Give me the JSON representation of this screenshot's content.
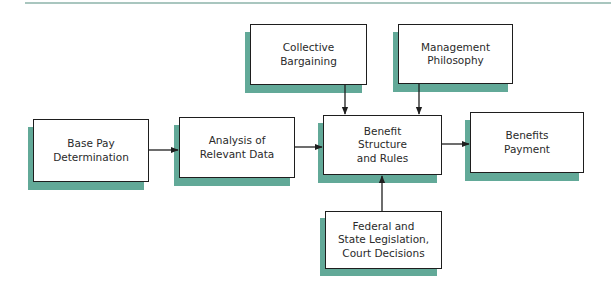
{
  "diagram": {
    "nodes": [
      {
        "id": "base-pay",
        "label": "Base Pay\nDetermination"
      },
      {
        "id": "analysis",
        "label": "Analysis of\nRelevant Data"
      },
      {
        "id": "benefit-structure",
        "label": "Benefit\nStructure\nand Rules"
      },
      {
        "id": "benefits-payment",
        "label": "Benefits\nPayment"
      },
      {
        "id": "collective-bargaining",
        "label": "Collective\nBargaining"
      },
      {
        "id": "management-philosophy",
        "label": "Management\nPhilosophy"
      },
      {
        "id": "legislation",
        "label": "Federal and\nState Legislation,\nCourt Decisions"
      }
    ],
    "edges": [
      {
        "from": "base-pay",
        "to": "analysis"
      },
      {
        "from": "analysis",
        "to": "benefit-structure"
      },
      {
        "from": "benefit-structure",
        "to": "benefits-payment"
      },
      {
        "from": "collective-bargaining",
        "to": "benefit-structure"
      },
      {
        "from": "management-philosophy",
        "to": "benefit-structure"
      },
      {
        "from": "legislation",
        "to": "benefit-structure"
      }
    ],
    "colors": {
      "shadow": "#62a998",
      "border": "#1e1e1e",
      "rule": "#a9c6bf"
    }
  }
}
